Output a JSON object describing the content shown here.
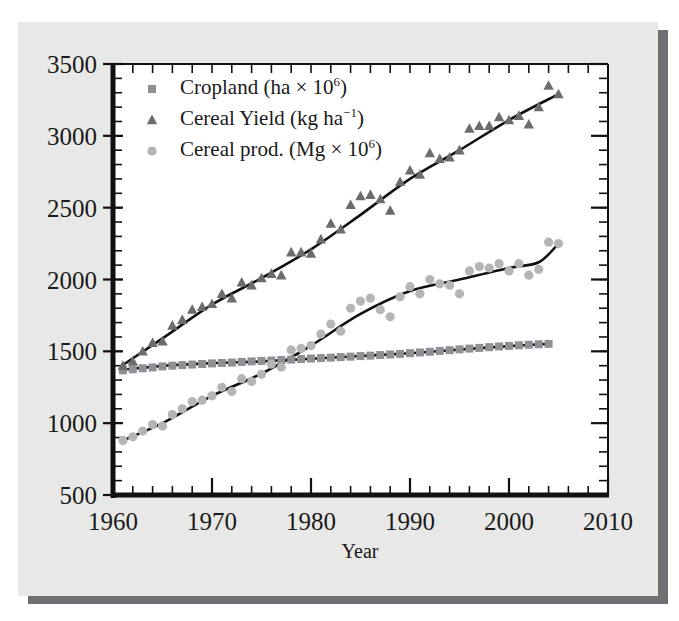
{
  "chart_data": {
    "type": "scatter",
    "title": "",
    "xlabel": "Year",
    "ylabel": "",
    "xlim": [
      1960,
      2010
    ],
    "ylim": [
      500,
      3500
    ],
    "xticks": [
      1960,
      1970,
      1980,
      1990,
      2000,
      2010
    ],
    "yticks": [
      500,
      1000,
      1500,
      2000,
      2500,
      3000,
      3500
    ],
    "xtick_labels": [
      "1960",
      "1970",
      "1980",
      "1990",
      "2000",
      "2010"
    ],
    "ytick_labels": [
      "500",
      "1000",
      "1500",
      "2000",
      "2500",
      "3000",
      "3500"
    ],
    "x_minor_tick_step": 2,
    "y_minor_tick_step": 100,
    "grid": false,
    "legend_position": "upper-left-inside",
    "series": [
      {
        "name": "Cropland (ha × 10⁶)",
        "label_main": "Cropland (ha × 10",
        "label_sup": "6",
        "label_tail": ")",
        "marker": "square",
        "color": "#8f9094",
        "trend_color": "#111111",
        "x": [
          1961,
          1962,
          1963,
          1964,
          1965,
          1966,
          1967,
          1968,
          1969,
          1970,
          1971,
          1972,
          1973,
          1974,
          1975,
          1976,
          1977,
          1978,
          1979,
          1980,
          1981,
          1982,
          1983,
          1984,
          1985,
          1986,
          1987,
          1988,
          1989,
          1990,
          1991,
          1992,
          1993,
          1994,
          1995,
          1996,
          1997,
          1998,
          1999,
          2000,
          2001,
          2002,
          2003,
          2004
        ],
        "values": [
          1368,
          1375,
          1382,
          1388,
          1395,
          1400,
          1404,
          1408,
          1412,
          1416,
          1419,
          1422,
          1426,
          1430,
          1433,
          1436,
          1440,
          1443,
          1447,
          1450,
          1453,
          1456,
          1460,
          1463,
          1467,
          1470,
          1474,
          1478,
          1482,
          1487,
          1492,
          1497,
          1503,
          1508,
          1514,
          1519,
          1524,
          1529,
          1534,
          1538,
          1542,
          1546,
          1549,
          1552
        ],
        "trend": [
          {
            "x": 1961,
            "y": 1372
          },
          {
            "x": 1965,
            "y": 1399
          },
          {
            "x": 1970,
            "y": 1418
          },
          {
            "x": 1975,
            "y": 1430
          },
          {
            "x": 1980,
            "y": 1448
          },
          {
            "x": 1985,
            "y": 1467
          },
          {
            "x": 1990,
            "y": 1487
          },
          {
            "x": 1995,
            "y": 1512
          },
          {
            "x": 2000,
            "y": 1536
          },
          {
            "x": 2004,
            "y": 1552
          }
        ]
      },
      {
        "name": "Cereal Yield (kg ha⁻¹)",
        "label_main": "Cereal Yield (kg ha",
        "label_sup": "−1",
        "label_tail": ")",
        "marker": "triangle",
        "color": "#6b6c70",
        "trend_color": "#111111",
        "x": [
          1961,
          1962,
          1963,
          1964,
          1965,
          1966,
          1967,
          1968,
          1969,
          1970,
          1971,
          1972,
          1973,
          1974,
          1975,
          1976,
          1977,
          1978,
          1979,
          1980,
          1981,
          1982,
          1983,
          1984,
          1985,
          1986,
          1987,
          1988,
          1989,
          1990,
          1991,
          1992,
          1993,
          1994,
          1995,
          1996,
          1997,
          1998,
          1999,
          2000,
          2001,
          2002,
          2003,
          2004,
          2005
        ],
        "values": [
          1400,
          1430,
          1500,
          1560,
          1570,
          1680,
          1720,
          1790,
          1810,
          1830,
          1900,
          1870,
          1980,
          1960,
          2010,
          2040,
          2030,
          2190,
          2190,
          2180,
          2280,
          2390,
          2350,
          2520,
          2580,
          2590,
          2560,
          2480,
          2680,
          2760,
          2730,
          2880,
          2840,
          2850,
          2900,
          3050,
          3070,
          3070,
          3130,
          3110,
          3140,
          3080,
          3200,
          3350,
          3290
        ],
        "trend": [
          {
            "x": 1961,
            "y": 1405
          },
          {
            "x": 1965,
            "y": 1590
          },
          {
            "x": 1970,
            "y": 1825
          },
          {
            "x": 1975,
            "y": 2010
          },
          {
            "x": 1980,
            "y": 2210
          },
          {
            "x": 1985,
            "y": 2450
          },
          {
            "x": 1990,
            "y": 2700
          },
          {
            "x": 1995,
            "y": 2900
          },
          {
            "x": 2000,
            "y": 3110
          },
          {
            "x": 2005,
            "y": 3290
          }
        ]
      },
      {
        "name": "Cereal prod. (Mg × 10⁶)",
        "label_main": "Cereal prod. (Mg × 10",
        "label_sup": "6",
        "label_tail": ")",
        "marker": "circle",
        "color": "#b4b5b7",
        "trend_color": "#111111",
        "x": [
          1961,
          1962,
          1963,
          1964,
          1965,
          1966,
          1967,
          1968,
          1969,
          1970,
          1971,
          1972,
          1973,
          1974,
          1975,
          1976,
          1977,
          1978,
          1979,
          1980,
          1981,
          1982,
          1983,
          1984,
          1985,
          1986,
          1987,
          1988,
          1989,
          1990,
          1991,
          1992,
          1993,
          1994,
          1995,
          1996,
          1997,
          1998,
          1999,
          2000,
          2001,
          2002,
          2003,
          2004,
          2005
        ],
        "values": [
          880,
          905,
          945,
          990,
          980,
          1060,
          1100,
          1150,
          1160,
          1190,
          1250,
          1220,
          1310,
          1290,
          1340,
          1410,
          1390,
          1510,
          1520,
          1540,
          1620,
          1690,
          1640,
          1800,
          1850,
          1870,
          1790,
          1740,
          1880,
          1950,
          1900,
          2000,
          1970,
          1960,
          1900,
          2060,
          2090,
          2080,
          2110,
          2060,
          2110,
          2030,
          2070,
          2260,
          2250
        ],
        "trend": [
          {
            "x": 1961,
            "y": 880
          },
          {
            "x": 1965,
            "y": 1000
          },
          {
            "x": 1970,
            "y": 1190
          },
          {
            "x": 1975,
            "y": 1345
          },
          {
            "x": 1980,
            "y": 1540
          },
          {
            "x": 1985,
            "y": 1760
          },
          {
            "x": 1990,
            "y": 1920
          },
          {
            "x": 1995,
            "y": 2000
          },
          {
            "x": 2000,
            "y": 2080
          },
          {
            "x": 2003,
            "y": 2120
          },
          {
            "x": 2005,
            "y": 2250
          }
        ]
      }
    ]
  },
  "legend": {
    "items": [
      {
        "marker": "square",
        "text": "Cropland (ha × 10⁶)"
      },
      {
        "marker": "triangle",
        "text": "Cereal Yield (kg ha⁻¹)"
      },
      {
        "marker": "circle",
        "text": "Cereal prod. (Mg × 10⁶)"
      }
    ]
  },
  "colors": {
    "page_background": "#e8e8e6",
    "page_shadow": "#6e7073",
    "axis": "#111111",
    "cropland_marker": "#8f9094",
    "yield_marker": "#6b6c70",
    "production_marker": "#b4b5b7"
  }
}
